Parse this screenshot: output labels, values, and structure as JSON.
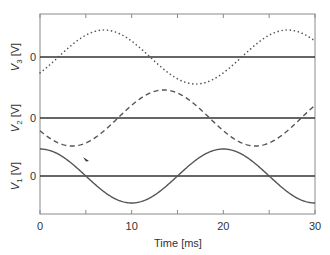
{
  "chart_data": {
    "type": "line",
    "title": "",
    "xlabel": "Time [ms]",
    "xlim": [
      0,
      30
    ],
    "x_ticks": [
      0,
      5,
      10,
      15,
      20,
      25,
      30
    ],
    "x_tick_labels": [
      "0",
      "10",
      "20",
      "30"
    ],
    "grid": false,
    "legend": "none",
    "panels": [
      {
        "ylabel": "V3 [V]",
        "ylabel_main": "V",
        "ylabel_sub": "3",
        "ylabel_unit": " [V]",
        "zero_label": "0",
        "style": "dotted",
        "function": "sine",
        "period_ms": 20,
        "phase_zero_crossing_rising_ms": 2,
        "relative_amplitude": 1.0,
        "x": [
          0,
          2,
          7,
          12,
          17,
          22,
          27,
          30
        ],
        "y": [
          -0.31,
          0,
          1,
          0,
          -1,
          0,
          1,
          0.81
        ]
      },
      {
        "ylabel": "V2 [V]",
        "ylabel_main": "V",
        "ylabel_sub": "2",
        "ylabel_unit": " [V]",
        "zero_label": "0",
        "style": "dashed",
        "function": "sine",
        "period_ms": 20,
        "phase_zero_crossing_rising_ms": 8.5,
        "relative_amplitude": 1.0,
        "x": [
          0,
          3.5,
          8.5,
          13.5,
          18.5,
          23.5,
          28.5,
          30
        ],
        "y": [
          -0.45,
          -1,
          0,
          1,
          0,
          -1,
          0,
          0.45
        ]
      },
      {
        "ylabel": "V1 [V]",
        "ylabel_main": "V",
        "ylabel_sub": "1",
        "ylabel_unit": " [V]",
        "zero_label": "0",
        "style": "solid",
        "function": "cosine",
        "period_ms": 20,
        "relative_amplitude": 1.0,
        "x": [
          0,
          5,
          10,
          15,
          20,
          25,
          30
        ],
        "y": [
          1,
          0,
          -1,
          0,
          1,
          0,
          -1
        ]
      }
    ],
    "annotations": [
      "small arrow mark near V1 curve at t≈5 ms"
    ]
  }
}
